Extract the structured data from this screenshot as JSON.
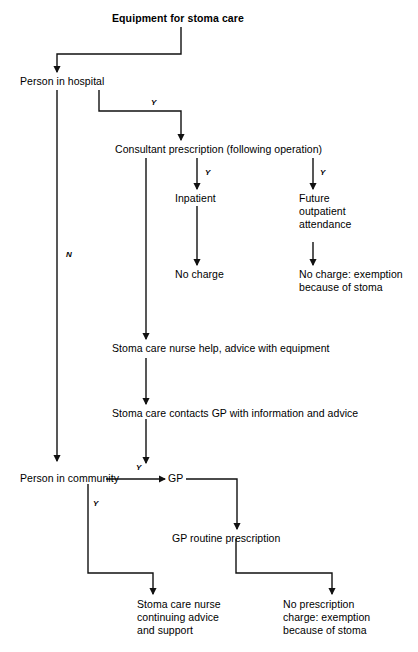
{
  "diagram": {
    "type": "flowchart",
    "title": "Equipment for stoma care",
    "nodes": {
      "title": "Equipment for stoma care",
      "person_in_hospital": "Person in hospital",
      "consultant_prescription": "Consultant prescription (following operation)",
      "inpatient": "Inpatient",
      "future_outpatient": "Future\noutpatient\nattendance",
      "no_charge": "No charge",
      "no_charge_exemption": "No charge: exemption\nbecause of stoma",
      "stoma_care_nurse_help": "Stoma care nurse help, advice with equipment",
      "stoma_care_contacts_gp": "Stoma care contacts GP with information and advice",
      "person_in_community": "Person in community",
      "gp": "GP",
      "gp_routine_prescription": "GP routine prescription",
      "stoma_care_nurse_continuing": "Stoma care nurse\ncontinuing advice\nand support",
      "no_prescription_charge": "No prescription\ncharge: exemption\nbecause of stoma"
    },
    "edge_labels": {
      "hospital_to_consultant": "Y",
      "hospital_to_community": "N",
      "consultant_to_inpatient": "Y",
      "consultant_to_outpatient": "Y",
      "community_to_gp": "Y",
      "community_to_nurse": "Y"
    },
    "colors": {
      "background": "#ffffff",
      "ink": "#000000",
      "line": "#1a1a1a"
    }
  }
}
